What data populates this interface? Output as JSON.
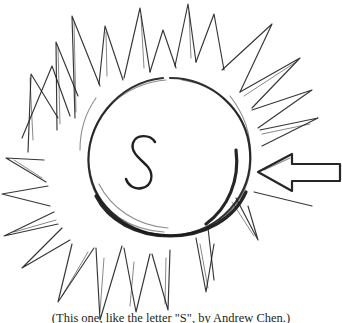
{
  "figure": {
    "kind": "hand-drawn-sketch",
    "background_color": "#ffffff",
    "ink_color": "#1a1a1a",
    "width": 342,
    "height": 323,
    "center_label": "S",
    "annotation_arrow": {
      "name": "pointer-arrow",
      "direction": "left",
      "points_at": "sun-edge"
    }
  },
  "caption": {
    "text": "(This one, like the letter \"S\", by Andrew Chen.)"
  }
}
